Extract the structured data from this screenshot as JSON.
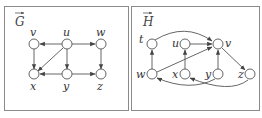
{
  "panels": [
    {
      "title": "G",
      "title_decoration": "vector-arrow",
      "nodes": [
        {
          "id": "v",
          "label": "v"
        },
        {
          "id": "u",
          "label": "u"
        },
        {
          "id": "w",
          "label": "w"
        },
        {
          "id": "x",
          "label": "x"
        },
        {
          "id": "y",
          "label": "y"
        },
        {
          "id": "z",
          "label": "z"
        }
      ],
      "edges": [
        {
          "from": "u",
          "to": "v"
        },
        {
          "from": "u",
          "to": "w"
        },
        {
          "from": "u",
          "to": "x"
        },
        {
          "from": "u",
          "to": "y"
        },
        {
          "from": "v",
          "to": "x"
        },
        {
          "from": "w",
          "to": "z"
        },
        {
          "from": "y",
          "to": "x"
        },
        {
          "from": "y",
          "to": "z"
        }
      ]
    },
    {
      "title": "H",
      "title_decoration": "vector-arrow",
      "nodes": [
        {
          "id": "t",
          "label": "t"
        },
        {
          "id": "u",
          "label": "u"
        },
        {
          "id": "v",
          "label": "v"
        },
        {
          "id": "w",
          "label": "w"
        },
        {
          "id": "x",
          "label": "x"
        },
        {
          "id": "y",
          "label": "y"
        },
        {
          "id": "z",
          "label": "z"
        }
      ],
      "edges": [
        {
          "from": "t",
          "to": "v",
          "curved": true
        },
        {
          "from": "u",
          "to": "v"
        },
        {
          "from": "w",
          "to": "v"
        },
        {
          "from": "w",
          "to": "t"
        },
        {
          "from": "x",
          "to": "u"
        },
        {
          "from": "y",
          "to": "v"
        },
        {
          "from": "v",
          "to": "z"
        },
        {
          "from": "y",
          "to": "w",
          "curved": true
        },
        {
          "from": "z",
          "to": "x",
          "curved": true
        }
      ]
    }
  ],
  "colors": {
    "border": "#8a8a8a",
    "stroke": "#555555",
    "text": "#333333"
  }
}
